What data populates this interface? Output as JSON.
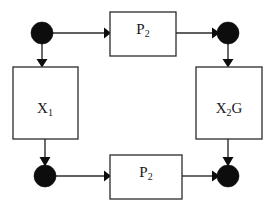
{
  "diagram": {
    "background_color": "#ffffff",
    "stroke_color": "#2b2b2b",
    "node_fill_color": "#0d0d0d",
    "box_fill_color": "#ffffff",
    "nodes": [
      {
        "id": "node-top-left",
        "shape": "filled-circle",
        "label": "",
        "cx": 42,
        "cy": 33,
        "r": 11
      },
      {
        "id": "node-top-right",
        "shape": "filled-circle",
        "label": "",
        "cx": 228,
        "cy": 33,
        "r": 11
      },
      {
        "id": "node-bottom-left",
        "shape": "filled-circle",
        "label": "",
        "cx": 45,
        "cy": 176,
        "r": 11
      },
      {
        "id": "node-bottom-right",
        "shape": "filled-circle",
        "label": "",
        "cx": 228,
        "cy": 176,
        "r": 11
      }
    ],
    "boxes": [
      {
        "id": "box-p2-top",
        "label_base": "P",
        "label_sub": "2",
        "label_text": "P2",
        "x": 110,
        "y": 12,
        "width": 66,
        "height": 44
      },
      {
        "id": "box-x1",
        "label_base": "X",
        "label_sub": "1",
        "label_text": "X1",
        "x": 13,
        "y": 67,
        "width": 65,
        "height": 72
      },
      {
        "id": "box-x2g",
        "label_base": "X",
        "label_sub": "2",
        "label_suffix": "G",
        "label_text": "X2G",
        "x": 196,
        "y": 67,
        "width": 66,
        "height": 72
      },
      {
        "id": "box-p2-bottom",
        "label_base": "P",
        "label_sub": "2",
        "label_text": "P2",
        "x": 110,
        "y": 155,
        "width": 72,
        "height": 44
      }
    ],
    "edges": [
      {
        "id": "edge-topleft-node-to-p2top",
        "from": "node-top-left",
        "to": "box-p2-top",
        "direction": "right"
      },
      {
        "id": "edge-p2top-to-topright-node",
        "from": "box-p2-top",
        "to": "node-top-right",
        "direction": "right"
      },
      {
        "id": "edge-topleft-node-to-x1",
        "from": "node-top-left",
        "to": "box-x1",
        "direction": "down"
      },
      {
        "id": "edge-topright-node-to-x2g",
        "from": "node-top-right",
        "to": "box-x2g",
        "direction": "down"
      },
      {
        "id": "edge-x1-to-bottomleft-node",
        "from": "box-x1",
        "to": "node-bottom-left",
        "direction": "down"
      },
      {
        "id": "edge-x2g-to-bottomright-node",
        "from": "box-x2g",
        "to": "node-bottom-right",
        "direction": "down"
      },
      {
        "id": "edge-bottomleft-node-to-p2bottom",
        "from": "node-bottom-left",
        "to": "box-p2-bottom",
        "direction": "right"
      },
      {
        "id": "edge-p2bottom-to-bottomright-node",
        "from": "box-p2-bottom",
        "to": "node-bottom-right",
        "direction": "right"
      }
    ]
  }
}
